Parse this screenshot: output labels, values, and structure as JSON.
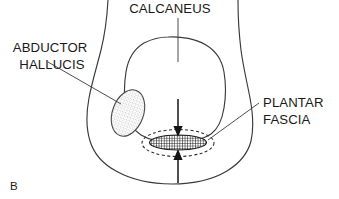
{
  "figure": {
    "panel_letter": "B",
    "background_color": "#ffffff",
    "line_color": "#3a3a3a",
    "arrow_color": "#141414",
    "text_color": "#1a1a1a"
  },
  "labels": [
    {
      "id": "calcaneus",
      "lines": [
        "CALCANEUS"
      ],
      "text_anchor": "middle",
      "x": 170,
      "y": 13,
      "line_height": 16
    },
    {
      "id": "abductor-hallucis",
      "lines": [
        "ABDUCTOR",
        "HALLUCIS"
      ],
      "text_anchor": "middle",
      "x": 52,
      "y": 52,
      "line_height": 17
    },
    {
      "id": "plantar-fascia",
      "lines": [
        "PLANTAR",
        "FASCIA"
      ],
      "text_anchor": "start",
      "x": 263,
      "y": 107,
      "line_height": 17
    }
  ],
  "structures": {
    "heel_contour_name": "heel-soft-tissue-contour",
    "calcaneus_name": "calcaneus-bone",
    "abductor_hallucis_name": "abductor-hallucis-muscle",
    "plantar_fascia_name": "plantar-fascia-band",
    "fascia_halo_name": "plantar-fascia-dashed-boundary"
  },
  "arrows": {
    "superior_label": "downward-compression-arrow",
    "inferior_label": "upward-compression-arrow"
  }
}
